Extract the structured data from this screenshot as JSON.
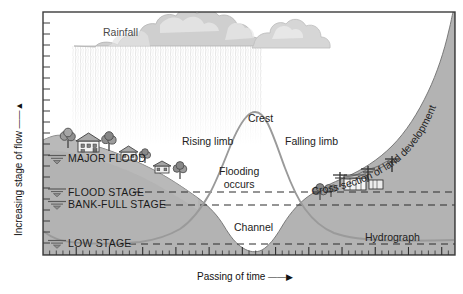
{
  "figure": {
    "background_color": "#ffffff",
    "frame_color": "#3c3c3c",
    "terrain_color": "#b3b3b3",
    "hydrograph_color": "#9a9a9a",
    "dash_color": "#333333",
    "cloud_color": "#cfcfcf",
    "rain_color": "#e2e2e2"
  },
  "axes": {
    "y_label": "Increasing stage of flow",
    "y_arrow": "▲",
    "x_label": "Passing of time",
    "x_arrow": "▶",
    "y_tick_count": 22,
    "x_tick_count": 62,
    "grid": false
  },
  "stage_lines": [
    {
      "id": "major-flood",
      "label": "MAJOR FLOOD",
      "dashed": false,
      "marker": true
    },
    {
      "id": "flood-stage",
      "label": "FLOOD STAGE",
      "dashed": true,
      "marker": true
    },
    {
      "id": "bank-full-stage",
      "label": "BANK-FULL STAGE",
      "dashed": true,
      "marker": true
    },
    {
      "id": "low-stage",
      "label": "LOW STAGE",
      "dashed": true,
      "marker": true
    }
  ],
  "annotations": {
    "rainfall": "Rainfall",
    "rising_limb": "Rising limb",
    "crest": "Crest",
    "falling_limb": "Falling limb",
    "flooding_occurs_line1": "Flooding",
    "flooding_occurs_line2": "occurs",
    "channel": "Channel",
    "hydrograph": "Hydrograph",
    "cross_section": "Cross section of land development"
  },
  "chart_data": {
    "type": "line",
    "title": "Hydrograph",
    "xlabel": "Passing of time",
    "ylabel": "Increasing stage of flow",
    "series": [
      {
        "name": "Hydrograph",
        "x": [
          43,
          70,
          100,
          130,
          160,
          180,
          195,
          210,
          225,
          238,
          248,
          258,
          268,
          278,
          290,
          305,
          320,
          340,
          365,
          395,
          430,
          455
        ],
        "y": [
          232,
          240,
          243,
          243,
          241,
          232,
          215,
          185,
          150,
          126,
          115,
          112,
          118,
          132,
          160,
          190,
          212,
          228,
          236,
          239,
          240,
          240
        ]
      }
    ],
    "annotations": [
      {
        "text": "Rising limb",
        "x": 205,
        "y": 141
      },
      {
        "text": "Crest",
        "x": 263,
        "y": 118
      },
      {
        "text": "Falling limb",
        "x": 312,
        "y": 141
      },
      {
        "text": "Flooding occurs",
        "x": 253,
        "y": 172
      },
      {
        "text": "Channel",
        "x": 255,
        "y": 228
      },
      {
        "text": "Hydrograph",
        "x": 392,
        "y": 238
      }
    ],
    "reference_lines": [
      {
        "label": "MAJOR FLOOD",
        "y": 158
      },
      {
        "label": "FLOOD STAGE",
        "y": 192
      },
      {
        "label": "BANK-FULL STAGE",
        "y": 205
      },
      {
        "label": "LOW STAGE",
        "y": 244
      }
    ]
  }
}
